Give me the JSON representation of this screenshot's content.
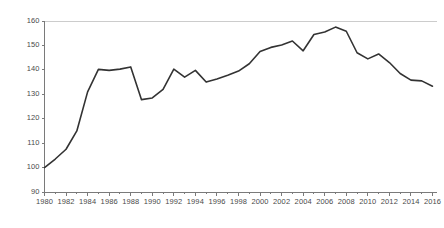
{
  "chart_data": {
    "type": "line",
    "title": "",
    "subtitle": "",
    "xlabel": "",
    "ylabel": "",
    "xlim": [
      1980,
      2016
    ],
    "ylim": [
      90,
      160
    ],
    "ytick_values": [
      90,
      100,
      110,
      120,
      130,
      140,
      150,
      160
    ],
    "ytick_labels": [
      "90",
      "100",
      "110",
      "120",
      "130",
      "140",
      "150",
      "160"
    ],
    "xtick_values": [
      1980,
      1982,
      1984,
      1986,
      1988,
      1990,
      1992,
      1994,
      1996,
      1998,
      2000,
      2002,
      2004,
      2006,
      2008,
      2010,
      2012,
      2014,
      2016
    ],
    "xtick_labels": [
      "1980",
      "1982",
      "1984",
      "1986",
      "1988",
      "1990",
      "1992",
      "1994",
      "1996",
      "1998",
      "2000",
      "2002",
      "2004",
      "2006",
      "2008",
      "2010",
      "2012",
      "2014",
      "2016"
    ],
    "xminor_step": 1,
    "grid": "top-line-only",
    "legend": "none",
    "series": [
      {
        "name": "index",
        "color": "#333333",
        "line_width": 1.6,
        "x": [
          1980,
          1981,
          1982,
          1983,
          1984,
          1985,
          1986,
          1987,
          1988,
          1989,
          1990,
          1991,
          1992,
          1993,
          1994,
          1995,
          1996,
          1997,
          1998,
          1999,
          2000,
          2001,
          2002,
          2003,
          2004,
          2005,
          2006,
          2007,
          2008,
          2009,
          2010,
          2011,
          2012,
          2013,
          2014,
          2015,
          2016
        ],
        "values": [
          100.0,
          103.5,
          107.5,
          115.0,
          131.0,
          140.2,
          139.8,
          140.3,
          141.2,
          127.8,
          128.5,
          132.0,
          140.3,
          137.0,
          139.8,
          135.0,
          136.3,
          137.8,
          139.5,
          142.5,
          147.5,
          149.2,
          150.2,
          151.8,
          147.8,
          154.5,
          155.5,
          157.5,
          155.8,
          147.0,
          144.5,
          146.5,
          143.0,
          138.5,
          135.8,
          135.5,
          133.3
        ]
      }
    ],
    "colors": {
      "line": "#333333",
      "axis": "#7a7a7a",
      "gridline": "#cccccc",
      "tick_text": "#4a4a4a",
      "background": "#ffffff"
    }
  }
}
